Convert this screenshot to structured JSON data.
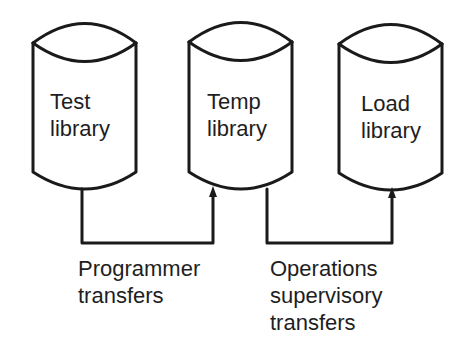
{
  "diagram": {
    "libraries": [
      {
        "line1": "Test",
        "line2": "library"
      },
      {
        "line1": "Temp",
        "line2": "library"
      },
      {
        "line1": "Load",
        "line2": "library"
      }
    ],
    "transfers": [
      {
        "line1": "Programmer",
        "line2": "transfers"
      },
      {
        "line1": "Operations",
        "line2": "supervisory",
        "line3": "transfers"
      }
    ],
    "colors": {
      "stroke": "#1a1a1a",
      "background": "#ffffff"
    }
  }
}
